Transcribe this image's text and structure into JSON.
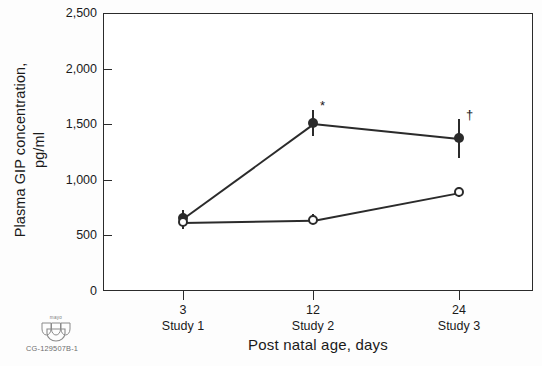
{
  "chart_data": {
    "type": "line",
    "title": "",
    "xlabel": "Post natal age, days",
    "ylabel": "Plasma GIP concentration, pg/ml",
    "ylabel_line1": "Plasma GIP concentration,",
    "ylabel_line2": "pg/ml",
    "x": [
      3,
      12,
      24
    ],
    "xtick_labels": [
      "3",
      "12",
      "24"
    ],
    "xtick_sublabels": [
      "Study 1",
      "Study 2",
      "Study 3"
    ],
    "ytick_labels": [
      "0",
      "500",
      "1,000",
      "1,500",
      "2,000",
      "2,500"
    ],
    "ytick_values": [
      0,
      500,
      1000,
      1500,
      2000,
      2500
    ],
    "ylim": [
      0,
      2500
    ],
    "grid": false,
    "legend": "none",
    "series": [
      {
        "name": "filled-circle-series",
        "marker": "filled-circle",
        "values": [
          660,
          1510,
          1375
        ],
        "err_low": [
          590,
          1390,
          1200
        ],
        "err_high": [
          730,
          1630,
          1545
        ],
        "annotations": [
          "",
          "*",
          "†"
        ]
      },
      {
        "name": "open-circle-series",
        "marker": "open-circle",
        "values": [
          620,
          640,
          890
        ],
        "err_low": [
          560,
          600,
          845
        ],
        "err_high": [
          690,
          690,
          935
        ],
        "annotations": [
          "",
          "",
          ""
        ]
      }
    ]
  },
  "footer": {
    "logo_word": "mayo",
    "logo_name": "mayo-clinic-shield-logo",
    "code": "CG-129507B-1"
  }
}
